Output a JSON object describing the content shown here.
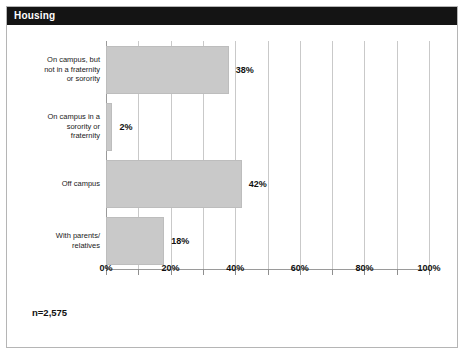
{
  "header": {
    "title": "Housing"
  },
  "footnote": {
    "text": "n=2,575"
  },
  "chart_data": {
    "type": "bar",
    "orientation": "horizontal",
    "title": "Housing",
    "xlabel": "",
    "ylabel": "",
    "xlim": [
      0,
      100
    ],
    "grid": true,
    "legend": "none",
    "annotation": "n=2,575",
    "categories": [
      "On campus, but\nnot in a fraternity\nor sorority",
      "On campus in a\nsorority or\nfraternity",
      "Off campus",
      "With parents/\nrelatives"
    ],
    "values": [
      38,
      2,
      42,
      18
    ],
    "value_labels": [
      "38%",
      "2%",
      "42%",
      "18%"
    ],
    "xticks": [
      0,
      20,
      40,
      60,
      80,
      100
    ],
    "xtick_labels": [
      "0%",
      "20%",
      "40%",
      "60%",
      "80%",
      "100%"
    ],
    "minor_xticks": [
      10,
      30,
      50,
      70,
      90
    ],
    "bar_color": "#c9c9c9",
    "bar_border_color": "#bdbdbd",
    "gridline_color": "#c9c9c9",
    "axis_color": "#9a9a9a",
    "header_bg": "#141414",
    "header_fg": "#ffffff"
  }
}
